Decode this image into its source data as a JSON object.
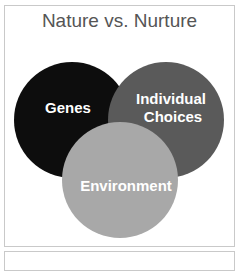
{
  "diagram": {
    "title": "Nature vs. Nurture",
    "type": "venn",
    "circles": [
      {
        "id": "genes",
        "label_lines": [
          "Genes"
        ],
        "color": "#0d0d0d"
      },
      {
        "id": "individual-choices",
        "label_lines": [
          "Individual",
          "Choices"
        ],
        "color": "#5a5a5a"
      },
      {
        "id": "environment",
        "label_lines": [
          "Environment"
        ],
        "color": "#a8a8a8"
      }
    ]
  }
}
